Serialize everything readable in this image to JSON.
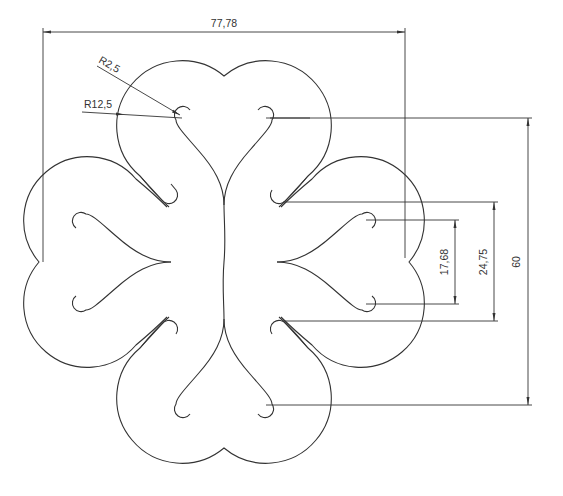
{
  "drawing": {
    "title": "Four-heart ornament drawing",
    "center": [
      224,
      262
    ],
    "colors": {
      "line": "#333333",
      "background": "#ffffff"
    }
  },
  "dimensions": {
    "overall_width": {
      "label": "77,78",
      "x1": 43,
      "x2": 405,
      "y": 32,
      "text_x": 224,
      "text_y": 26
    },
    "overall_height": {
      "label": "60",
      "x": 527,
      "y1": 118,
      "y2": 405,
      "text_x": 516,
      "text_y": 262
    },
    "tail_span": {
      "label": "24,75",
      "x": 494,
      "y1": 202,
      "y2": 321,
      "text_x": 484,
      "text_y": 262
    },
    "hook_span": {
      "label": "17,68",
      "x": 455,
      "y1": 220,
      "y2": 304,
      "text_x": 444,
      "text_y": 262
    },
    "radius_small": {
      "label": "R2,5",
      "text_x": 98,
      "text_y": 64
    },
    "radius_large": {
      "label": "R12,5",
      "text_x": 82,
      "text_y": 108
    }
  }
}
